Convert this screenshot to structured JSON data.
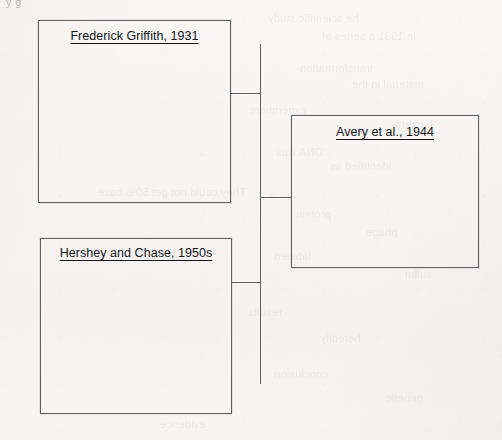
{
  "page": {
    "kind": "scanned-worksheet",
    "paper_color": "#f5f4f2",
    "ink_color": "#14161a",
    "line_color": "#5e6064",
    "top_cropped_fragment": "y g"
  },
  "diagram": {
    "type": "bracket-concept-map",
    "nodes": [
      {
        "id": "griffith",
        "label": "Frederick Griffith, 1931",
        "underlined": true,
        "body_text": "",
        "x": 38,
        "y": 20,
        "width": 193,
        "height": 183
      },
      {
        "id": "avery",
        "label": "Avery et al., 1944",
        "underlined": true,
        "body_text": "",
        "x": 291,
        "y": 115,
        "width": 188,
        "height": 153
      },
      {
        "id": "hershey",
        "label": "Hershey and Chase, 1950s",
        "underlined": true,
        "body_text": "",
        "x": 40,
        "y": 238,
        "width": 192,
        "height": 176
      }
    ],
    "connectors": [
      {
        "id": "trunk",
        "orientation": "vertical",
        "x": 260,
        "y": 44,
        "length": 340
      },
      {
        "id": "stub-griffith",
        "orientation": "horizontal",
        "x": 231,
        "y": 93,
        "length": 30
      },
      {
        "id": "stub-avery",
        "orientation": "horizontal",
        "x": 260,
        "y": 197,
        "length": 32
      },
      {
        "id": "stub-hershey",
        "orientation": "horizontal",
        "x": 231,
        "y": 282,
        "length": 30
      }
    ]
  },
  "bleed_through": [
    {
      "text": "he scientific study",
      "x": 268,
      "y": 12,
      "size": 11,
      "mirrored": true
    },
    {
      "text": "in 1931 a series of",
      "x": 322,
      "y": 30,
      "size": 11,
      "mirrored": true
    },
    {
      "text": "transformation",
      "x": 300,
      "y": 62,
      "size": 11,
      "mirrored": true
    },
    {
      "text": "material in the",
      "x": 352,
      "y": 78,
      "size": 11,
      "mirrored": true
    },
    {
      "text": "experiment",
      "x": 250,
      "y": 104,
      "size": 11,
      "mirrored": true
    },
    {
      "text": "bacteria",
      "x": 392,
      "y": 118,
      "size": 11,
      "mirrored": true
    },
    {
      "text": "DNA was",
      "x": 276,
      "y": 146,
      "size": 11,
      "mirrored": true
    },
    {
      "text": "identified as",
      "x": 330,
      "y": 160,
      "size": 11,
      "mirrored": true
    },
    {
      "text": "They could not get 50% base",
      "x": 98,
      "y": 186,
      "size": 11,
      "mirrored": true
    },
    {
      "text": "protein",
      "x": 296,
      "y": 208,
      "size": 11,
      "mirrored": true
    },
    {
      "text": "phage",
      "x": 366,
      "y": 226,
      "size": 11,
      "mirrored": true
    },
    {
      "text": "labeled",
      "x": 274,
      "y": 250,
      "size": 11,
      "mirrored": true
    },
    {
      "text": "sulfur",
      "x": 404,
      "y": 268,
      "size": 11,
      "mirrored": true
    },
    {
      "text": "results",
      "x": 248,
      "y": 306,
      "size": 11,
      "mirrored": true
    },
    {
      "text": "heredity",
      "x": 320,
      "y": 332,
      "size": 11,
      "mirrored": true
    },
    {
      "text": "conclusion",
      "x": 274,
      "y": 368,
      "size": 11,
      "mirrored": true
    },
    {
      "text": "genetic",
      "x": 386,
      "y": 392,
      "size": 11,
      "mirrored": true
    },
    {
      "text": "evidence",
      "x": 160,
      "y": 418,
      "size": 11,
      "mirrored": true
    }
  ]
}
